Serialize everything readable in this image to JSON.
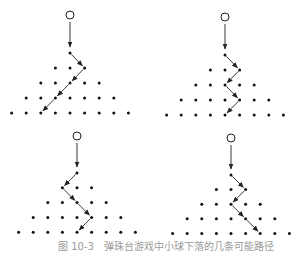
{
  "figure": {
    "caption": "图 10-3　弹珠台游戏中小球下落的几条可能路径",
    "colors": {
      "peg": "#111111",
      "path": "#222222",
      "ball_stroke": "#222222",
      "background": "#ffffff"
    },
    "panels": [
      {
        "id": "top-left",
        "ball": {
          "x": 70,
          "y": 15,
          "r": 4
        },
        "origin": {
          "x": 70,
          "y": 53
        },
        "dx": 14.6,
        "dy": 15,
        "rows": 5,
        "path_directions": [
          "R",
          "L",
          "L",
          "L"
        ]
      },
      {
        "id": "top-right",
        "ball": {
          "x": 225,
          "y": 17,
          "r": 4
        },
        "origin": {
          "x": 225,
          "y": 55
        },
        "dx": 14.6,
        "dy": 15,
        "rows": 5,
        "path_directions": [
          "R",
          "L",
          "R",
          "L"
        ]
      },
      {
        "id": "bottom-left",
        "ball": {
          "x": 77,
          "y": 136,
          "r": 4
        },
        "origin": {
          "x": 77,
          "y": 173
        },
        "dx": 14.6,
        "dy": 14.8,
        "rows": 5,
        "path_directions": [
          "L",
          "R",
          "R",
          "L"
        ]
      },
      {
        "id": "bottom-right",
        "ball": {
          "x": 231,
          "y": 138,
          "r": 4
        },
        "origin": {
          "x": 231,
          "y": 175
        },
        "dx": 14.6,
        "dy": 14.6,
        "rows": 5,
        "path_directions": [
          "R",
          "L",
          "R",
          "R"
        ]
      }
    ]
  }
}
